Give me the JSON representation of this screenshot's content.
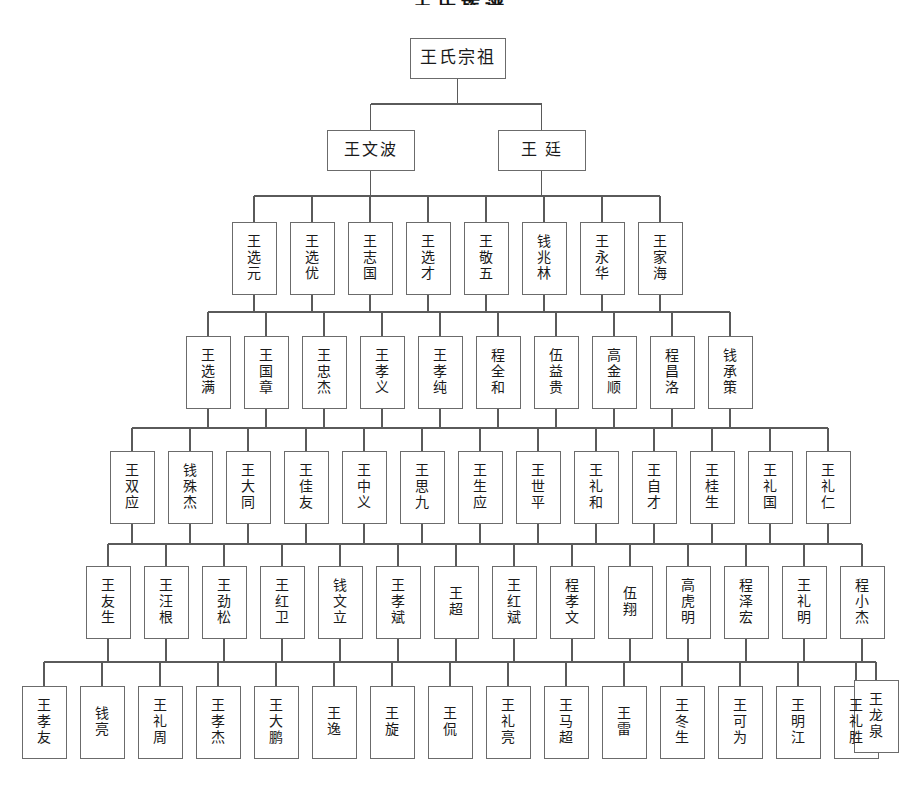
{
  "document": {
    "title": "王氏族谱",
    "type": "genealogy-tree",
    "background_color": "#ffffff",
    "box_stroke_color": "#6b6b6b",
    "connector_color": "#5a5a5a",
    "text_color": "#1a1a1a"
  },
  "chart_data": {
    "type": "tree",
    "title": "王氏族谱",
    "orientation": "top-down",
    "generations": 8,
    "levels": [
      {
        "index": 0,
        "label": "始祖",
        "nodes": [
          {
            "name": "王氏宗祖",
            "x": 410,
            "y": 38,
            "w": 95,
            "h": 40,
            "font": 17,
            "layout": "horizontal"
          }
        ]
      },
      {
        "index": 1,
        "label": "第二世",
        "nodes": [
          {
            "name": "王文波",
            "x": 327,
            "y": 130,
            "w": 87,
            "h": 40,
            "font": 16,
            "layout": "horizontal"
          },
          {
            "name": "王 廷",
            "x": 498,
            "y": 130,
            "w": 87,
            "h": 40,
            "font": 16,
            "layout": "horizontal"
          }
        ]
      },
      {
        "index": 2,
        "label": "第三世",
        "nodes": [
          {
            "name": "王选元",
            "x": 232,
            "y": 222,
            "w": 44,
            "h": 72,
            "font": 14,
            "layout": "vertical"
          },
          {
            "name": "王选优",
            "x": 290,
            "y": 222,
            "w": 44,
            "h": 72,
            "font": 14,
            "layout": "vertical"
          },
          {
            "name": "王志国",
            "x": 348,
            "y": 222,
            "w": 44,
            "h": 72,
            "font": 14,
            "layout": "vertical"
          },
          {
            "name": "王选才",
            "x": 406,
            "y": 222,
            "w": 44,
            "h": 72,
            "font": 14,
            "layout": "vertical"
          },
          {
            "name": "王敬五",
            "x": 464,
            "y": 222,
            "w": 44,
            "h": 72,
            "font": 14,
            "layout": "vertical"
          },
          {
            "name": "钱兆林",
            "x": 522,
            "y": 222,
            "w": 44,
            "h": 72,
            "font": 14,
            "layout": "vertical"
          },
          {
            "name": "王永华",
            "x": 580,
            "y": 222,
            "w": 44,
            "h": 72,
            "font": 14,
            "layout": "vertical"
          },
          {
            "name": "王家海",
            "x": 638,
            "y": 222,
            "w": 44,
            "h": 72,
            "font": 14,
            "layout": "vertical"
          }
        ]
      },
      {
        "index": 3,
        "label": "第四世",
        "nodes": [
          {
            "name": "王选满",
            "x": 186,
            "y": 336,
            "w": 44,
            "h": 72,
            "font": 14,
            "layout": "vertical"
          },
          {
            "name": "王国章",
            "x": 244,
            "y": 336,
            "w": 44,
            "h": 72,
            "font": 14,
            "layout": "vertical"
          },
          {
            "name": "王忠杰",
            "x": 302,
            "y": 336,
            "w": 44,
            "h": 72,
            "font": 14,
            "layout": "vertical"
          },
          {
            "name": "王孝义",
            "x": 360,
            "y": 336,
            "w": 44,
            "h": 72,
            "font": 14,
            "layout": "vertical"
          },
          {
            "name": "王孝纯",
            "x": 418,
            "y": 336,
            "w": 44,
            "h": 72,
            "font": 14,
            "layout": "vertical"
          },
          {
            "name": "程全和",
            "x": 476,
            "y": 336,
            "w": 44,
            "h": 72,
            "font": 14,
            "layout": "vertical"
          },
          {
            "name": "伍益贵",
            "x": 534,
            "y": 336,
            "w": 44,
            "h": 72,
            "font": 14,
            "layout": "vertical"
          },
          {
            "name": "高金顺",
            "x": 592,
            "y": 336,
            "w": 44,
            "h": 72,
            "font": 14,
            "layout": "vertical"
          },
          {
            "name": "程昌洛",
            "x": 650,
            "y": 336,
            "w": 44,
            "h": 72,
            "font": 14,
            "layout": "vertical"
          },
          {
            "name": "钱承策",
            "x": 708,
            "y": 336,
            "w": 44,
            "h": 72,
            "font": 14,
            "layout": "vertical"
          }
        ]
      },
      {
        "index": 4,
        "label": "第五世",
        "nodes": [
          {
            "name": "王双应",
            "x": 110,
            "y": 451,
            "w": 44,
            "h": 72,
            "font": 14,
            "layout": "vertical"
          },
          {
            "name": "钱殊杰",
            "x": 168,
            "y": 451,
            "w": 44,
            "h": 72,
            "font": 14,
            "layout": "vertical"
          },
          {
            "name": "王大同",
            "x": 226,
            "y": 451,
            "w": 44,
            "h": 72,
            "font": 14,
            "layout": "vertical"
          },
          {
            "name": "王佳友",
            "x": 284,
            "y": 451,
            "w": 44,
            "h": 72,
            "font": 14,
            "layout": "vertical"
          },
          {
            "name": "王中义",
            "x": 342,
            "y": 451,
            "w": 44,
            "h": 72,
            "font": 14,
            "layout": "vertical"
          },
          {
            "name": "王思九",
            "x": 400,
            "y": 451,
            "w": 44,
            "h": 72,
            "font": 14,
            "layout": "vertical"
          },
          {
            "name": "王生应",
            "x": 458,
            "y": 451,
            "w": 44,
            "h": 72,
            "font": 14,
            "layout": "vertical"
          },
          {
            "name": "王世平",
            "x": 516,
            "y": 451,
            "w": 44,
            "h": 72,
            "font": 14,
            "layout": "vertical"
          },
          {
            "name": "王礼和",
            "x": 574,
            "y": 451,
            "w": 44,
            "h": 72,
            "font": 14,
            "layout": "vertical"
          },
          {
            "name": "王自才",
            "x": 632,
            "y": 451,
            "w": 44,
            "h": 72,
            "font": 14,
            "layout": "vertical"
          },
          {
            "name": "王桂生",
            "x": 690,
            "y": 451,
            "w": 44,
            "h": 72,
            "font": 14,
            "layout": "vertical"
          },
          {
            "name": "王礼国",
            "x": 748,
            "y": 451,
            "w": 44,
            "h": 72,
            "font": 14,
            "layout": "vertical"
          },
          {
            "name": "王礼仁",
            "x": 806,
            "y": 451,
            "w": 44,
            "h": 72,
            "font": 14,
            "layout": "vertical"
          }
        ]
      },
      {
        "index": 5,
        "label": "第六世",
        "nodes": [
          {
            "name": "王友生",
            "x": 86,
            "y": 566,
            "w": 44,
            "h": 72,
            "font": 14,
            "layout": "vertical"
          },
          {
            "name": "王汪根",
            "x": 144,
            "y": 566,
            "w": 44,
            "h": 72,
            "font": 14,
            "layout": "vertical"
          },
          {
            "name": "王劲松",
            "x": 202,
            "y": 566,
            "w": 44,
            "h": 72,
            "font": 14,
            "layout": "vertical"
          },
          {
            "name": "王红卫",
            "x": 260,
            "y": 566,
            "w": 44,
            "h": 72,
            "font": 14,
            "layout": "vertical"
          },
          {
            "name": "钱文立",
            "x": 318,
            "y": 566,
            "w": 44,
            "h": 72,
            "font": 14,
            "layout": "vertical"
          },
          {
            "name": "王孝斌",
            "x": 376,
            "y": 566,
            "w": 44,
            "h": 72,
            "font": 14,
            "layout": "vertical"
          },
          {
            "name": "王超",
            "x": 434,
            "y": 566,
            "w": 44,
            "h": 72,
            "font": 14,
            "layout": "vertical"
          },
          {
            "name": "王红斌",
            "x": 492,
            "y": 566,
            "w": 44,
            "h": 72,
            "font": 14,
            "layout": "vertical"
          },
          {
            "name": "程孝文",
            "x": 550,
            "y": 566,
            "w": 44,
            "h": 72,
            "font": 14,
            "layout": "vertical"
          },
          {
            "name": "伍翔",
            "x": 608,
            "y": 566,
            "w": 44,
            "h": 72,
            "font": 14,
            "layout": "vertical"
          },
          {
            "name": "高虎明",
            "x": 666,
            "y": 566,
            "w": 44,
            "h": 72,
            "font": 14,
            "layout": "vertical"
          },
          {
            "name": "程泽宏",
            "x": 724,
            "y": 566,
            "w": 44,
            "h": 72,
            "font": 14,
            "layout": "vertical"
          },
          {
            "name": "王礼明",
            "x": 782,
            "y": 566,
            "w": 44,
            "h": 72,
            "font": 14,
            "layout": "vertical"
          },
          {
            "name": "程小杰",
            "x": 840,
            "y": 566,
            "w": 44,
            "h": 72,
            "font": 14,
            "layout": "vertical"
          }
        ]
      },
      {
        "index": 6,
        "label": "第七世",
        "nodes": [
          {
            "name": "王孝友",
            "x": 22,
            "y": 686,
            "w": 44,
            "h": 72,
            "font": 14,
            "layout": "vertical"
          },
          {
            "name": "钱亮",
            "x": 80,
            "y": 686,
            "w": 44,
            "h": 72,
            "font": 14,
            "layout": "vertical"
          },
          {
            "name": "王礼周",
            "x": 138,
            "y": 686,
            "w": 44,
            "h": 72,
            "font": 14,
            "layout": "vertical"
          },
          {
            "name": "王孝杰",
            "x": 196,
            "y": 686,
            "w": 44,
            "h": 72,
            "font": 14,
            "layout": "vertical"
          },
          {
            "name": "王大鹏",
            "x": 254,
            "y": 686,
            "w": 44,
            "h": 72,
            "font": 14,
            "layout": "vertical"
          },
          {
            "name": "王逸",
            "x": 312,
            "y": 686,
            "w": 44,
            "h": 72,
            "font": 14,
            "layout": "vertical"
          },
          {
            "name": "王旋",
            "x": 370,
            "y": 686,
            "w": 44,
            "h": 72,
            "font": 14,
            "layout": "vertical"
          },
          {
            "name": "王侃",
            "x": 428,
            "y": 686,
            "w": 44,
            "h": 72,
            "font": 14,
            "layout": "vertical"
          },
          {
            "name": "王礼亮",
            "x": 486,
            "y": 686,
            "w": 44,
            "h": 72,
            "font": 14,
            "layout": "vertical"
          },
          {
            "name": "王马超",
            "x": 544,
            "y": 686,
            "w": 44,
            "h": 72,
            "font": 14,
            "layout": "vertical"
          },
          {
            "name": "王雷",
            "x": 602,
            "y": 686,
            "w": 44,
            "h": 72,
            "font": 14,
            "layout": "vertical"
          },
          {
            "name": "王冬生",
            "x": 660,
            "y": 686,
            "w": 44,
            "h": 72,
            "font": 14,
            "layout": "vertical"
          },
          {
            "name": "王可为",
            "x": 718,
            "y": 686,
            "w": 44,
            "h": 72,
            "font": 14,
            "layout": "vertical"
          },
          {
            "name": "王明江",
            "x": 776,
            "y": 686,
            "w": 44,
            "h": 72,
            "font": 14,
            "layout": "vertical"
          },
          {
            "name": "王礼胜",
            "x": 834,
            "y": 686,
            "w": 44,
            "h": 72,
            "font": 14,
            "layout": "vertical"
          }
        ]
      }
    ],
    "bus_lines": [
      {
        "from_level": 0,
        "to_level": 1,
        "y": 104
      },
      {
        "from_level": 1,
        "to_level": 2,
        "y": 196
      },
      {
        "from_level": 2,
        "to_level": 3,
        "y": 312
      },
      {
        "from_level": 3,
        "to_level": 4,
        "y": 428
      },
      {
        "from_level": 4,
        "to_level": 5,
        "y": 544
      },
      {
        "from_level": 5,
        "to_level": 6,
        "y": 662
      }
    ],
    "extra_node": {
      "name": "王龙泉",
      "x": 854,
      "y": 680,
      "w": 44,
      "h": 72,
      "font": 14,
      "layout": "vertical",
      "level": 6
    }
  }
}
